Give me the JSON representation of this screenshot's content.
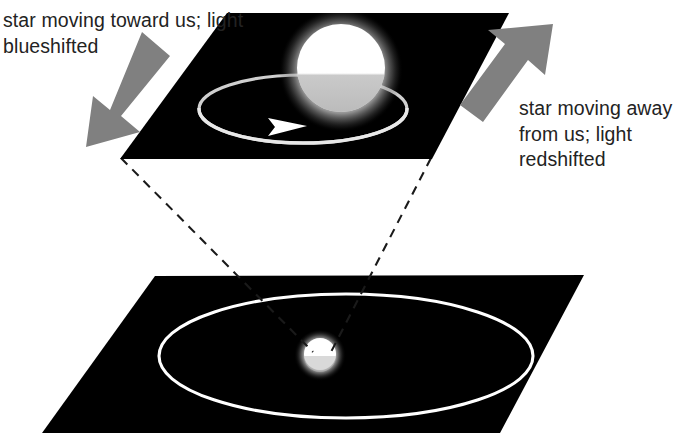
{
  "figure": {
    "background_color": "#ffffff",
    "panel_color": "#000000",
    "orbit_color": "#ffffff",
    "arrow_color": "#808080",
    "dashed_line_color": "#1a1a1a",
    "text_color": "#232323"
  },
  "captions": {
    "blueshift": "star moving toward us; light blueshifted",
    "redshift": "star moving away from us; light redshifted"
  },
  "upper_panel": {
    "name": "orbital plane close-up",
    "star_label": "star",
    "orbit_label": "orbit ellipse",
    "motion_arrow_label": "direction of orbital motion"
  },
  "lower_panel": {
    "name": "orbital plane wide view",
    "star_label": "star",
    "orbit_label": "orbit ellipse"
  },
  "annotations": {
    "left_arrow_label": "motion toward observer",
    "right_arrow_label": "motion away from observer",
    "zoom_line_label": "magnification callout"
  }
}
